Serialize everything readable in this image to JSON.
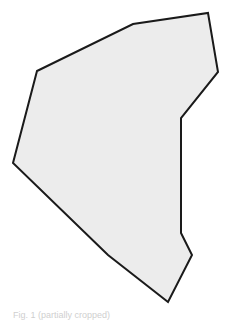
{
  "shape": {
    "type": "polygon",
    "fill": "#ececec",
    "stroke": "#1a1a1a",
    "stroke_width": 2,
    "points": [
      [
        37,
        71
      ],
      [
        133,
        24
      ],
      [
        208,
        13
      ],
      [
        218,
        72
      ],
      [
        181,
        118
      ],
      [
        181,
        233
      ],
      [
        192,
        255
      ],
      [
        168,
        302
      ],
      [
        108,
        255
      ],
      [
        13,
        163
      ]
    ]
  },
  "caption": {
    "text": "Fig. 1 (partially cropped)"
  }
}
